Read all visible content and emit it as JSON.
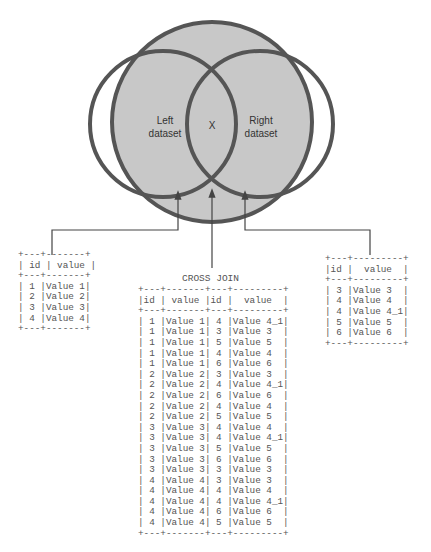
{
  "venn": {
    "left_label": "Left\ndataset",
    "center_label": "X",
    "right_label": "Right\ndataset",
    "colors": {
      "fill": "#c8c8c8",
      "stroke": "#555555",
      "arrow": "#444444"
    }
  },
  "left_table": {
    "columns": [
      "id",
      "value"
    ],
    "rows": [
      [
        "1",
        "Value 1"
      ],
      [
        "2",
        "Value 2"
      ],
      [
        "3",
        "Value 3"
      ],
      [
        "4",
        "Value 4"
      ]
    ],
    "text": "+---+-------+\n| id | value |\n+---+-------+\n| 1 |Value 1|\n| 2 |Value 2|\n| 3 |Value 3|\n| 4 |Value 4|\n+---+-------+"
  },
  "right_table": {
    "columns": [
      "id",
      "value"
    ],
    "rows": [
      [
        "3",
        "Value 3"
      ],
      [
        "4",
        "Value 4"
      ],
      [
        "4",
        "Value 4_1"
      ],
      [
        "5",
        "Value 5"
      ],
      [
        "6",
        "Value 6"
      ]
    ],
    "text": "+---+---------+\n|id |  value  |\n+---+---------+\n| 3 |Value 3  |\n| 4 |Value 4  |\n| 4 |Value 4_1|\n| 5 |Value 5  |\n| 6 |Value 6  |\n+---+---------+"
  },
  "cross_join": {
    "title": "CROSS JOIN",
    "columns": [
      "id",
      "value",
      "id",
      "value"
    ],
    "rows": [
      [
        "1",
        "Value 1",
        "4",
        "Value 4_1"
      ],
      [
        "1",
        "Value 1",
        "3",
        "Value 3"
      ],
      [
        "1",
        "Value 1",
        "5",
        "Value 5"
      ],
      [
        "1",
        "Value 1",
        "4",
        "Value 4"
      ],
      [
        "1",
        "Value 1",
        "6",
        "Value 6"
      ],
      [
        "2",
        "Value 2",
        "3",
        "Value 3"
      ],
      [
        "2",
        "Value 2",
        "4",
        "Value 4_1"
      ],
      [
        "2",
        "Value 2",
        "6",
        "Value 6"
      ],
      [
        "2",
        "Value 2",
        "4",
        "Value 4"
      ],
      [
        "2",
        "Value 2",
        "5",
        "Value 5"
      ],
      [
        "3",
        "Value 3",
        "4",
        "Value 4"
      ],
      [
        "3",
        "Value 3",
        "4",
        "Value 4_1"
      ],
      [
        "3",
        "Value 3",
        "5",
        "Value 5"
      ],
      [
        "3",
        "Value 3",
        "6",
        "Value 6"
      ],
      [
        "3",
        "Value 3",
        "3",
        "Value 3"
      ],
      [
        "4",
        "Value 4",
        "3",
        "Value 3"
      ],
      [
        "4",
        "Value 4",
        "4",
        "Value 4"
      ],
      [
        "4",
        "Value 4",
        "4",
        "Value 4_1"
      ],
      [
        "4",
        "Value 4",
        "6",
        "Value 6"
      ],
      [
        "4",
        "Value 4",
        "5",
        "Value 5"
      ]
    ],
    "text": "+---+-------+---+---------+\n|id | value |id |  value  |\n+---+-------+---+---------+\n| 1 |Value 1| 4 |Value 4_1|\n| 1 |Value 1| 3 |Value 3  |\n| 1 |Value 1| 5 |Value 5  |\n| 1 |Value 1| 4 |Value 4  |\n| 1 |Value 1| 6 |Value 6  |\n| 2 |Value 2| 3 |Value 3  |\n| 2 |Value 2| 4 |Value 4_1|\n| 2 |Value 2| 6 |Value 6  |\n| 2 |Value 2| 4 |Value 4  |\n| 2 |Value 2| 5 |Value 5  |\n| 3 |Value 3| 4 |Value 4  |\n| 3 |Value 3| 4 |Value 4_1|\n| 3 |Value 3| 5 |Value 5  |\n| 3 |Value 3| 6 |Value 6  |\n| 3 |Value 3| 3 |Value 3  |\n| 4 |Value 4| 3 |Value 3  |\n| 4 |Value 4| 4 |Value 4  |\n| 4 |Value 4| 4 |Value 4_1|\n| 4 |Value 4| 6 |Value 6  |\n| 4 |Value 4| 5 |Value 5  |\n+---+-------+---+---------+"
  }
}
